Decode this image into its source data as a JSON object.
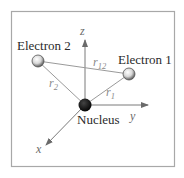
{
  "diagram": {
    "type": "atomic-coordinate-diagram",
    "frame": {
      "x": 11,
      "y": 11,
      "width": 164,
      "height": 156,
      "stroke": "#a8a8a8"
    },
    "colors": {
      "line": "#9a9a9a",
      "axis": "#7a7a7a",
      "nucleus": "#111111",
      "electron_fill": "#f2f2f2",
      "electron_stroke": "#555555",
      "label": "#2a2a2a",
      "distance_label": "#8a8a8a"
    },
    "nucleus": {
      "label": "Nucleus",
      "cx": 85,
      "cy": 105,
      "r": 6.5
    },
    "electrons": [
      {
        "id": "electron-1",
        "label": "Electron 1",
        "cx": 129,
        "cy": 74,
        "r": 6
      },
      {
        "id": "electron-2",
        "label": "Electron 2",
        "cx": 38,
        "cy": 61,
        "r": 6
      }
    ],
    "axes": [
      {
        "name": "z",
        "label": "z",
        "x1": 85,
        "y1": 105,
        "x2": 85,
        "y2": 40
      },
      {
        "name": "y",
        "label": "y",
        "x1": 85,
        "y1": 105,
        "x2": 148,
        "y2": 105
      },
      {
        "name": "x",
        "label": "x",
        "x1": 85,
        "y1": 105,
        "x2": 46,
        "y2": 145
      }
    ],
    "distances": [
      {
        "name": "r1",
        "base": "r",
        "subscript": "1",
        "from": "nucleus",
        "to": "electron-1"
      },
      {
        "name": "r2",
        "base": "r",
        "subscript": "2",
        "from": "nucleus",
        "to": "electron-2"
      },
      {
        "name": "r12",
        "base": "r",
        "subscript": "12",
        "from": "electron-2",
        "to": "electron-1"
      }
    ]
  }
}
